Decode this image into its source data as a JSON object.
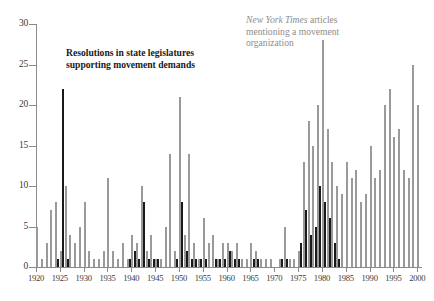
{
  "figure": {
    "annotations": {
      "black_series_label": "Resolutions in state legislatures supporting movement demands",
      "gray_series_label_italic": "New York Times",
      "gray_series_label_rest": " articles mentioning a movement organization"
    },
    "caption": ""
  },
  "colors": {
    "black_series": "#1a1a1a",
    "gray_series": "#9a9a9a",
    "axis": "#8a8a8a",
    "background": "#ffffff"
  },
  "chart_data": {
    "type": "bar",
    "title": "",
    "subtitle": "",
    "xlabel": "",
    "ylabel": "",
    "xlim": [
      1920,
      2001
    ],
    "ylim": [
      0,
      30
    ],
    "grid": false,
    "legend_position": "inline-annotations",
    "xticks": [
      1920,
      1925,
      1930,
      1935,
      1940,
      1945,
      1950,
      1955,
      1960,
      1965,
      1970,
      1975,
      1980,
      1985,
      1990,
      1995,
      2000
    ],
    "yticks": [
      0,
      5,
      10,
      15,
      20,
      25,
      30
    ],
    "x": [
      1920,
      1921,
      1922,
      1923,
      1924,
      1925,
      1926,
      1927,
      1928,
      1929,
      1930,
      1931,
      1932,
      1933,
      1934,
      1935,
      1936,
      1937,
      1938,
      1939,
      1940,
      1941,
      1942,
      1943,
      1944,
      1945,
      1946,
      1947,
      1948,
      1949,
      1950,
      1951,
      1952,
      1953,
      1954,
      1955,
      1956,
      1957,
      1958,
      1959,
      1960,
      1961,
      1962,
      1963,
      1964,
      1965,
      1966,
      1967,
      1968,
      1969,
      1970,
      1971,
      1972,
      1973,
      1974,
      1975,
      1976,
      1977,
      1978,
      1979,
      1980,
      1981,
      1982,
      1983,
      1984,
      1985,
      1986,
      1987,
      1988,
      1989,
      1990,
      1991,
      1992,
      1993,
      1994,
      1995,
      1996,
      1997,
      1998,
      1999,
      2000
    ],
    "series": [
      {
        "name": "Resolutions in state legislatures supporting movement demands",
        "color": "#1a1a1a",
        "values": [
          0,
          0,
          0,
          0,
          1,
          22,
          1,
          0,
          0,
          0,
          0,
          0,
          0,
          0,
          0,
          0,
          0,
          0,
          0,
          1,
          2,
          1,
          8,
          1,
          1,
          1,
          0,
          0,
          0,
          1,
          8,
          2,
          1,
          1,
          1,
          1,
          0,
          1,
          1,
          1,
          2,
          1,
          1,
          0,
          0,
          1,
          1,
          0,
          0,
          0,
          0,
          1,
          1,
          0,
          0,
          3,
          7,
          4,
          5,
          10,
          8,
          6,
          3,
          1,
          0,
          0,
          0,
          0,
          0,
          0,
          0,
          0,
          0,
          0,
          0,
          0,
          0,
          0,
          0,
          0,
          0
        ]
      },
      {
        "name": "New York Times articles mentioning a movement organization",
        "color": "#9a9a9a",
        "values": [
          5,
          1,
          3,
          7,
          8,
          2,
          10,
          4,
          3,
          5,
          8,
          2,
          1,
          1,
          2,
          11,
          2,
          1,
          3,
          1,
          4,
          3,
          10,
          2,
          4,
          1,
          1,
          5,
          14,
          2,
          21,
          4,
          14,
          3,
          1,
          6,
          3,
          4,
          1,
          3,
          3,
          2,
          3,
          1,
          1,
          3,
          2,
          1,
          1,
          1,
          0,
          1,
          5,
          1,
          1,
          2,
          13,
          18,
          15,
          20,
          28,
          17,
          13,
          10,
          9,
          13,
          11,
          12,
          8,
          9,
          15,
          11,
          12,
          20,
          22,
          16,
          17,
          12,
          11,
          25,
          20
        ]
      }
    ]
  }
}
